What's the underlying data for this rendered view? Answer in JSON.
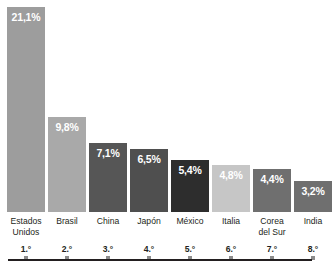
{
  "chart_data": {
    "type": "bar",
    "title": "",
    "subtitle": "",
    "xlabel": "",
    "ylabel": "",
    "ylim": [
      0,
      21.1
    ],
    "grid": false,
    "legend": "none",
    "value_suffix": "%",
    "decimal_separator": ",",
    "categories": [
      "Estados\nUnidos",
      "Brasil",
      "China",
      "Japón",
      "México",
      "Italia",
      "Corea\ndel Sur",
      "India"
    ],
    "values": [
      21.1,
      9.8,
      7.1,
      6.5,
      5.4,
      4.8,
      4.4,
      3.2
    ],
    "value_labels": [
      "21,1%",
      "9,8%",
      "7,1%",
      "6,5%",
      "5,4%",
      "4,8%",
      "4,4%",
      "3,2%"
    ],
    "rank_labels": [
      "1.°",
      "2.°",
      "3.°",
      "4.°",
      "5.°",
      "6.°",
      "7.°",
      "8.°"
    ],
    "bar_colors": [
      "#9d9d9d",
      "#a9a9a9",
      "#565656",
      "#4f4f4f",
      "#2d2d2d",
      "#c6c6c6",
      "#6f6f6f",
      "#6f6f6f"
    ],
    "label_colors": [
      "#ffffff",
      "#ffffff",
      "#ffffff",
      "#ffffff",
      "#ffffff",
      "#ffffff",
      "#ffffff",
      "#ffffff"
    ],
    "axis_color": "#231f20",
    "background": "#ffffff"
  }
}
